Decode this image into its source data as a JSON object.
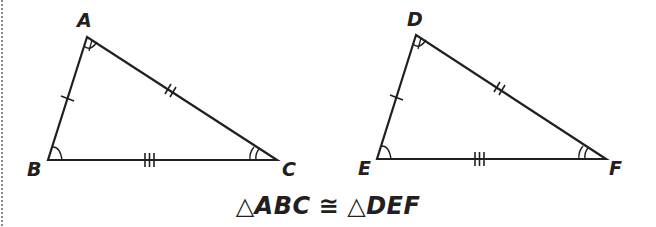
{
  "figure": {
    "stroke_color": "#231f20",
    "border_color": "#8a8a8a",
    "triangles": [
      {
        "name": "ABC",
        "vertices": {
          "A": {
            "label": "A",
            "x": 87,
            "y": 37
          },
          "B": {
            "label": "B",
            "x": 48,
            "y": 160
          },
          "C": {
            "label": "C",
            "x": 277,
            "y": 160
          }
        },
        "side_ticks": {
          "AB": 1,
          "AC": 2,
          "BC": 3
        },
        "angle_arcs": {
          "A": 1,
          "B": 1,
          "C": 2
        }
      },
      {
        "name": "DEF",
        "vertices": {
          "D": {
            "label": "D",
            "x": 416,
            "y": 35
          },
          "E": {
            "label": "E",
            "x": 377,
            "y": 159
          },
          "F": {
            "label": "F",
            "x": 606,
            "y": 159
          }
        },
        "side_ticks": {
          "DE": 1,
          "DF": 2,
          "EF": 3
        },
        "angle_arcs": {
          "D": 1,
          "E": 1,
          "F": 2
        }
      }
    ],
    "caption": {
      "triangle_symbol": "△",
      "left": "ABC",
      "relation": "≅",
      "right": "DEF"
    }
  }
}
